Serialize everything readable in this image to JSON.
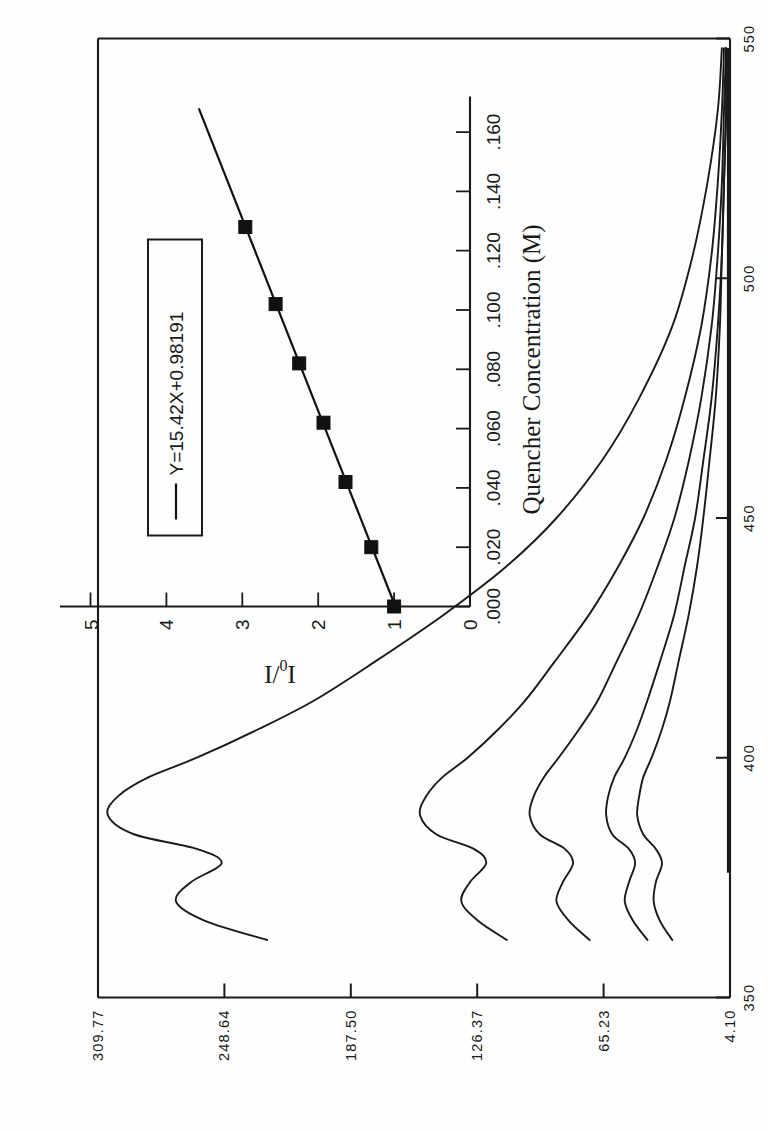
{
  "figure": {
    "orientation": "rotated-90-ccw",
    "background_color": "#fefefe",
    "ink_color": "#1a1a1a"
  },
  "chart_data": [
    {
      "id": "main-emission-spectra",
      "type": "line",
      "title": "",
      "xlabel": "WAVELENGTH  (NM)",
      "ylabel": "",
      "xlim": [
        350,
        550
      ],
      "ylim": [
        4.1,
        309.77
      ],
      "xticks": [
        350,
        400,
        450,
        500,
        550
      ],
      "xticklabels": [
        "350",
        "400",
        "450",
        "500",
        "550"
      ],
      "yticks": [
        4.1,
        65.23,
        126.37,
        187.5,
        248.64,
        309.77
      ],
      "yticklabels": [
        "4.10",
        "65.23",
        "126.37",
        "187.50",
        "248.64",
        "309.77"
      ],
      "grid": false,
      "legend": "none",
      "series": [
        {
          "name": "0.000 M quencher",
          "comment": "tallest emission curve",
          "x": [
            362,
            366,
            370,
            374,
            378,
            381,
            384,
            388,
            392,
            396,
            400,
            406,
            412,
            420,
            430,
            440,
            450,
            462,
            475,
            490,
            505,
            520,
            535,
            548
          ],
          "y": [
            228,
            258,
            272,
            265,
            250,
            262,
            292,
            305,
            300,
            285,
            262,
            232,
            205,
            176,
            142,
            112,
            88,
            66,
            48,
            32,
            22,
            15,
            10,
            8
          ]
        },
        {
          "name": "0.020 M quencher",
          "x": [
            362,
            366,
            370,
            374,
            378,
            381,
            384,
            388,
            392,
            396,
            400,
            406,
            412,
            420,
            430,
            440,
            450,
            462,
            475,
            490,
            505,
            520,
            535,
            548
          ],
          "y": [
            112,
            126,
            134,
            130,
            122,
            128,
            146,
            154,
            151,
            143,
            131,
            116,
            103,
            89,
            72,
            58,
            46,
            35,
            26,
            18,
            13,
            10,
            8,
            7
          ]
        },
        {
          "name": "0.050 M quencher",
          "x": [
            362,
            366,
            370,
            374,
            378,
            381,
            384,
            388,
            392,
            396,
            400,
            406,
            412,
            420,
            430,
            440,
            450,
            462,
            475,
            490,
            505,
            520,
            535,
            548
          ],
          "y": [
            72,
            82,
            88,
            85,
            80,
            84,
            96,
            101,
            99,
            94,
            87,
            77,
            68,
            59,
            48,
            39,
            31,
            24,
            18,
            13,
            10,
            8,
            7,
            6
          ]
        },
        {
          "name": "0.100 M quencher",
          "x": [
            362,
            366,
            370,
            374,
            378,
            381,
            384,
            388,
            392,
            396,
            400,
            406,
            412,
            420,
            430,
            440,
            450,
            462,
            475,
            490,
            505,
            520,
            535,
            548
          ],
          "y": [
            44,
            51,
            55,
            53,
            50,
            53,
            61,
            64,
            63,
            60,
            55,
            49,
            44,
            38,
            31,
            26,
            21,
            17,
            13,
            10,
            8,
            7,
            6,
            6
          ]
        },
        {
          "name": "0.140 M quencher",
          "x": [
            362,
            366,
            370,
            374,
            378,
            381,
            384,
            388,
            392,
            396,
            400,
            406,
            412,
            420,
            430,
            440,
            450,
            462,
            475,
            490,
            505,
            520,
            535,
            548
          ],
          "y": [
            32,
            38,
            41,
            40,
            37,
            40,
            46,
            49,
            48,
            46,
            42,
            37,
            33,
            29,
            24,
            20,
            17,
            14,
            11,
            9,
            8,
            7,
            6,
            6
          ]
        },
        {
          "name": "blank / baseline",
          "comment": "flat trace along the bottom of the frame",
          "x": [
            376,
            400,
            430,
            460,
            490,
            520,
            548
          ],
          "y": [
            5.0,
            5.0,
            5.0,
            5.0,
            5.0,
            5.0,
            5.0
          ]
        }
      ]
    },
    {
      "id": "inset-stern-volmer",
      "type": "scatter",
      "title": "",
      "xlabel": "Quencher Concentration (M)",
      "ylabel": "I0/I",
      "ylabel_parts": {
        "numerator": "I",
        "sub": "0",
        "denominator": "I"
      },
      "xlim": [
        0.0,
        0.172
      ],
      "ylim": [
        0,
        5.4
      ],
      "xticks": [
        0.0,
        0.02,
        0.04,
        0.06,
        0.08,
        0.1,
        0.12,
        0.14,
        0.16
      ],
      "xticklabels": [
        ".000",
        ".020",
        ".040",
        ".060",
        ".080",
        ".100",
        ".120",
        ".140",
        ".160"
      ],
      "yticks": [
        0,
        1,
        2,
        3,
        4,
        5
      ],
      "yticklabels": [
        "0",
        "1",
        "2",
        "3",
        "4",
        "5"
      ],
      "grid": false,
      "legend_position": "upper-left",
      "legend_entries": [
        {
          "label": "Y=15.42X+0.98191",
          "marker": "line"
        }
      ],
      "fit": {
        "slope": 15.42,
        "intercept": 0.98191,
        "equation": "Y=15.42X+0.98191"
      },
      "points": [
        {
          "x": 0.0,
          "y": 1.0
        },
        {
          "x": 0.02,
          "y": 1.3
        },
        {
          "x": 0.042,
          "y": 1.64
        },
        {
          "x": 0.062,
          "y": 1.93
        },
        {
          "x": 0.082,
          "y": 2.25
        },
        {
          "x": 0.102,
          "y": 2.56
        },
        {
          "x": 0.128,
          "y": 2.96
        }
      ]
    }
  ],
  "labels": {
    "main_axis_title": "WAVELENGTH  (NM)",
    "inset_axis_title": "Quencher Concentration (M)",
    "inset_ylabel": "I0/I",
    "legend_equation": "Y=15.42X+0.98191",
    "main_x_ticks": [
      "350",
      "400",
      "450",
      "500",
      "550"
    ],
    "main_y_ticks": [
      "4.10",
      "65.23",
      "126.37",
      "187.50",
      "248.64",
      "309.77"
    ],
    "inset_x_ticks": [
      ".000",
      ".020",
      ".040",
      ".060",
      ".080",
      ".100",
      ".120",
      ".140",
      ".160"
    ],
    "inset_y_ticks": [
      "0",
      "1",
      "2",
      "3",
      "4",
      "5"
    ]
  }
}
